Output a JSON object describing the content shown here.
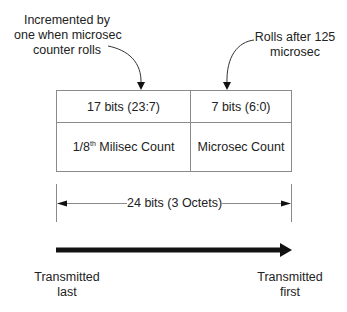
{
  "annotations": {
    "left": [
      "Incremented by",
      "one when microsec",
      "counter rolls"
    ],
    "right": [
      "Rolls after 125",
      "microsec"
    ]
  },
  "fields": [
    {
      "bits": "17 bits (23:7)",
      "name_prefix": "1/8",
      "name_sup": "th",
      "name_suffix": " Milisec Count"
    },
    {
      "bits": "7 bits (6:0)",
      "name": "Microsec Count"
    }
  ],
  "dimension_label": "24 bits (3 Octets)",
  "transmission": {
    "left": [
      "Transmitted",
      "last"
    ],
    "right": [
      "Transmitted",
      "first"
    ]
  },
  "colors": {
    "line": "#8a8a8a",
    "arrow": "#111111",
    "text": "#222222"
  }
}
